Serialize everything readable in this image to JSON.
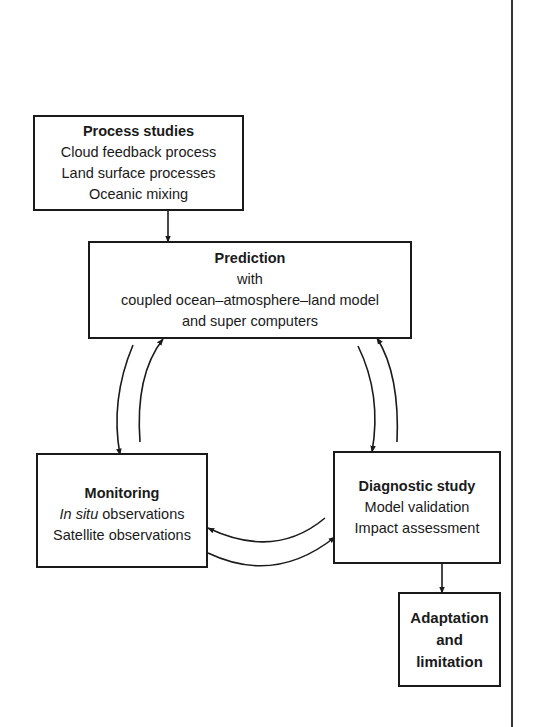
{
  "diagram": {
    "nodes": {
      "process": {
        "title": "Process studies",
        "lines": [
          "Cloud feedback process",
          "Land surface processes",
          "Oceanic mixing"
        ]
      },
      "prediction": {
        "title": "Prediction",
        "lines": [
          "with",
          "coupled ocean–atmosphere–land model",
          "and super computers"
        ]
      },
      "monitoring": {
        "title": "Monitoring",
        "lines": [
          {
            "italic": "In situ",
            "rest": " observations"
          },
          "Satellite observations"
        ]
      },
      "diagnostic": {
        "title": "Diagnostic study",
        "lines": [
          "Model validation",
          "Impact assessment"
        ]
      },
      "adaptation": {
        "lines": [
          "Adaptation",
          "and",
          "limitation"
        ]
      }
    },
    "edges": [
      {
        "from": "Process studies",
        "to": "Prediction"
      },
      {
        "from": "Prediction",
        "to": "Monitoring"
      },
      {
        "from": "Monitoring",
        "to": "Prediction"
      },
      {
        "from": "Prediction",
        "to": "Diagnostic study"
      },
      {
        "from": "Diagnostic study",
        "to": "Prediction"
      },
      {
        "from": "Diagnostic study",
        "to": "Monitoring"
      },
      {
        "from": "Monitoring",
        "to": "Diagnostic study"
      },
      {
        "from": "Diagnostic study",
        "to": "Adaptation and limitation"
      }
    ]
  }
}
